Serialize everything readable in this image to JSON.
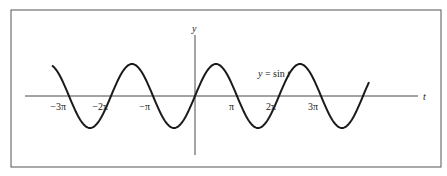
{
  "chart_data": {
    "type": "line",
    "title": "",
    "function": "sin t",
    "curve_label": "y = sin t",
    "xlabel": "t",
    "ylabel": "y",
    "x_ticks": [
      {
        "label": "−3π",
        "value": -9.42478
      },
      {
        "label": "−2π",
        "value": -6.28319
      },
      {
        "label": "−π",
        "value": -3.14159
      },
      {
        "label": "π",
        "value": 3.14159
      },
      {
        "label": "2π",
        "value": 6.28319
      },
      {
        "label": "3π",
        "value": 9.42478
      }
    ],
    "x_range": [
      -10.8,
      13.0
    ],
    "y_range": [
      -1,
      1
    ],
    "grid": false,
    "legend": "none"
  },
  "colors": {
    "curve": "#1a1a1a",
    "axis": "#333333",
    "frame": "#555555",
    "background": "#ffffff"
  },
  "layout": {
    "frame": {
      "x": 11,
      "y": 10,
      "w": 430,
      "h": 157
    },
    "origin_x": 195,
    "axis_y": 96,
    "px_per_pi": 42,
    "amplitude_px": 32,
    "x_axis_start": 25,
    "x_axis_end": 418,
    "y_axis_top": 35,
    "y_axis_bottom": 155,
    "curve_start_x": 52,
    "curve_end_x": 369
  }
}
